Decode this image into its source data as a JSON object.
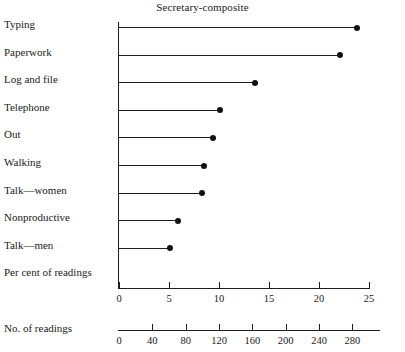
{
  "chart_data": {
    "type": "bar",
    "title": "Secretary-composite",
    "xlabel": "Per cent of readings",
    "xlabel_secondary": "No. of readings",
    "ylabel": "",
    "categories": [
      "Typing",
      "Paperwork",
      "Log and file",
      "Telephone",
      "Out",
      "Walking",
      "Talk—women",
      "Nonproductive",
      "Talk—men"
    ],
    "values": [
      23.8,
      22.1,
      13.6,
      10.1,
      9.4,
      8.5,
      8.3,
      5.9,
      5.1
    ],
    "values_count": [
      286,
      265,
      163,
      121,
      113,
      102,
      100,
      71,
      61
    ],
    "xlim": [
      0,
      26.5
    ],
    "ticks_percent": [
      0,
      5,
      10,
      15,
      20,
      25
    ],
    "ticks_count": [
      0,
      40,
      80,
      120,
      160,
      200,
      240,
      280
    ],
    "grid": false,
    "legend": "none",
    "marker": "filled-circle",
    "orientation": "horizontal",
    "line_color": "#1d1d1d",
    "marker_color": "#111111"
  }
}
